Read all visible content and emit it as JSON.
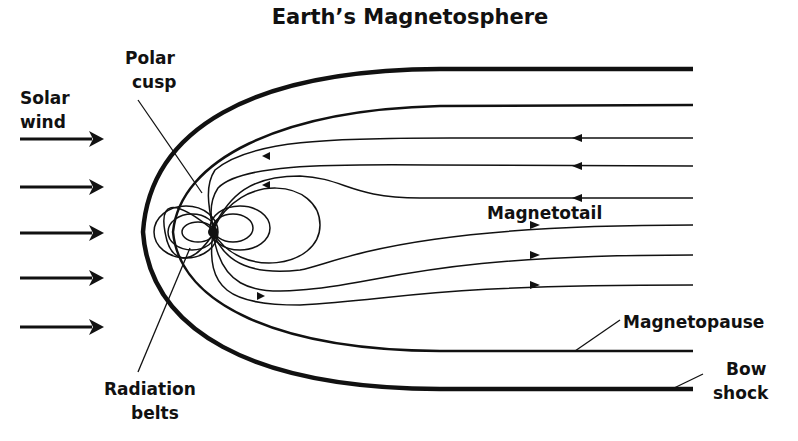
{
  "title": "Earth’s Magnetosphere",
  "labels": {
    "polar_cusp": [
      "Polar",
      "cusp"
    ],
    "solar_wind": [
      "Solar",
      "wind"
    ],
    "magnetotail": "Magnetotail",
    "magnetopause": "Magnetopause",
    "bow_shock": [
      "Bow",
      "shock"
    ],
    "radiation_belts": [
      "Radiation",
      "belts"
    ]
  },
  "solar_wind_arrows": 5,
  "colors": {
    "ink": "#111111",
    "background": "#ffffff"
  }
}
